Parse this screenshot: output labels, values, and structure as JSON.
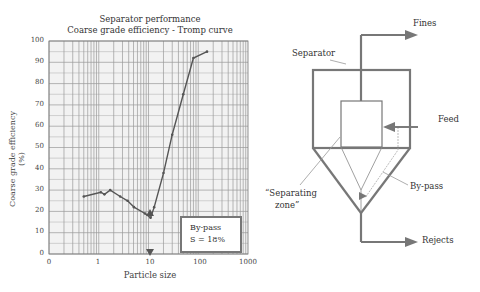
{
  "chart": {
    "title_line1": "Separator performance",
    "title_line2": "Coarse grade efficiency - Tromp curve",
    "ylabel": "Coarse grade efficiency (%)",
    "xlabel": "Particle size",
    "yticks": [
      "100",
      "90",
      "80",
      "70",
      "60",
      "50",
      "40",
      "30",
      "20",
      "10",
      "0"
    ],
    "xticks": [
      "0",
      "1",
      "10",
      "100",
      "1000"
    ],
    "annotation_line1": "By-pass",
    "annotation_line2": "S = 18%"
  },
  "diagram": {
    "fines": "Fines",
    "separator": "Separator",
    "feed": "Feed",
    "bypass": "By-pass",
    "zone_line1": "“Separating",
    "zone_line2": "zone”",
    "rejects": "Rejects"
  },
  "colors": {
    "grid": "#9a9a9a",
    "curve": "#555555",
    "diagram": "#777777"
  },
  "chart_data": {
    "type": "line",
    "xlabel": "Particle size",
    "ylabel": "Coarse grade efficiency (%)",
    "xscale": "log",
    "xlim": [
      0.1,
      1000
    ],
    "ylim": [
      0,
      100
    ],
    "xtick_labels": [
      "0",
      "1",
      "10",
      "100",
      "1000"
    ],
    "ytick_labels": [
      "0",
      "10",
      "20",
      "30",
      "40",
      "50",
      "60",
      "70",
      "80",
      "90",
      "100"
    ],
    "grid": true,
    "series": [
      {
        "name": "Tromp curve",
        "x": [
          0.5,
          1.1,
          1.3,
          1.7,
          2.7,
          3.8,
          5.1,
          8.5,
          11,
          13,
          20,
          30,
          50,
          80,
          150
        ],
        "y": [
          27,
          29,
          28,
          30,
          27,
          25,
          22,
          19,
          17,
          22,
          38,
          56,
          75,
          92,
          95
        ]
      }
    ],
    "annotations": [
      "By-pass S = 18%"
    ],
    "bypass_marker_x": 10
  }
}
